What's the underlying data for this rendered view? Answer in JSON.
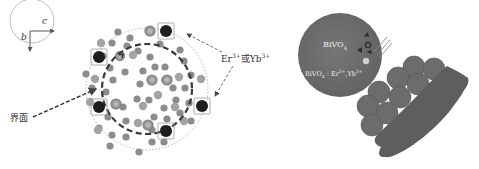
{
  "figure": {
    "left_panel": {
      "axis_indicator": {
        "axis_horizontal": "c",
        "axis_vertical": "b"
      },
      "dopant_label": {
        "text": "Er",
        "sup1": "3+",
        "mid": "或Yb",
        "sup2": "3+"
      },
      "interface_label": "界面"
    },
    "right_panel": {
      "particle_label": {
        "text": "BiVO",
        "sub": "4"
      },
      "shell_label": {
        "text": "BiVO",
        "sub": "4",
        "rest": " : Er",
        "sup1": "3+",
        "rest2": ",Yb",
        "sup2": "3+"
      }
    },
    "colors": {
      "background": "#ffffff",
      "dopant_ion": "#1e1e1e",
      "host_ion_light": "#9a9a9a",
      "host_ion_mid": "#7c7c7c",
      "large_ion_ring": "#888888",
      "large_ion_core": "#b0b0b0",
      "sphere_fill": "#6e6e6e",
      "substrate_fill": "#5e5e5e",
      "dashed_circle": "#3a3a3a",
      "dotted_outline": "#999999"
    }
  }
}
